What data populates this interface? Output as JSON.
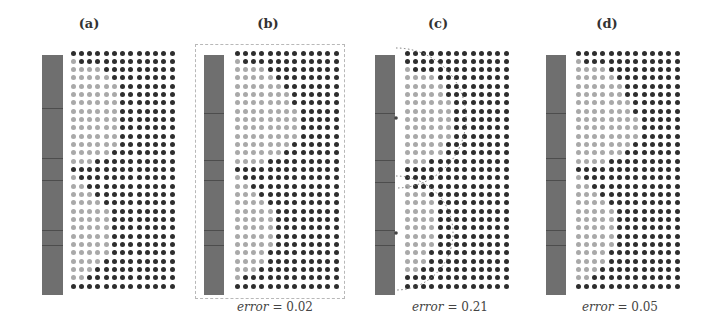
{
  "figure": {
    "grid": {
      "columns": 13,
      "rows": 29,
      "spacing_x": 8.25,
      "spacing_y": 8.33
    },
    "colors": {
      "dark_dot": "#2e2e2e",
      "light_dot": "#a9a9a9",
      "bar": "#6f6f6f",
      "frame": "#b8b8b8"
    },
    "panels": [
      {
        "id": "a",
        "label": "(a)",
        "label_x": 89,
        "bar": {
          "x": 42,
          "y": 55,
          "w": 21,
          "h": 240,
          "ticks": [
            108,
            158,
            180,
            230,
            245
          ]
        },
        "grid_origin": {
          "x": 73,
          "y": 53
        },
        "light_counts": [
          0,
          1,
          4,
          5,
          6,
          6,
          6,
          6,
          6,
          6,
          6,
          6,
          5,
          3,
          0,
          1,
          2,
          3,
          4,
          5,
          5,
          5,
          5,
          5,
          5,
          4,
          3,
          2,
          0
        ],
        "frame": null,
        "error": null,
        "circles": false
      },
      {
        "id": "b",
        "label": "(b)",
        "label_x": 268,
        "bar": {
          "x": 204,
          "y": 55,
          "w": 20,
          "h": 240,
          "ticks": [
            113,
            160,
            180,
            230,
            245
          ]
        },
        "grid_origin": {
          "x": 237,
          "y": 53
        },
        "light_counts": [
          0,
          1,
          4,
          5,
          6,
          7,
          7,
          8,
          8,
          8,
          8,
          7,
          6,
          4,
          0,
          1,
          2,
          3,
          4,
          5,
          5,
          5,
          5,
          5,
          4,
          4,
          3,
          1,
          0
        ],
        "frame": {
          "x": 195,
          "y": 44,
          "w": 150,
          "h": 255
        },
        "error": {
          "word": "error",
          "value": "= 0.02",
          "x": 275
        },
        "circles": false
      },
      {
        "id": "c",
        "label": "(c)",
        "label_x": 438,
        "bar": {
          "x": 375,
          "y": 55,
          "w": 20,
          "h": 240,
          "ticks": [
            113,
            160,
            182,
            230,
            245
          ]
        },
        "grid_origin": {
          "x": 407,
          "y": 53
        },
        "light_counts": [
          0,
          0,
          1,
          4,
          5,
          5,
          6,
          6,
          6,
          6,
          6,
          5,
          5,
          3,
          0,
          0,
          1,
          3,
          4,
          4,
          4,
          4,
          4,
          4,
          3,
          3,
          2,
          0,
          0
        ],
        "frame": null,
        "error": {
          "word": "error",
          "value": "= 0.21",
          "x": 450
        },
        "circles": true,
        "circle_marks": [
          {
            "cx": 396,
            "cy": 118,
            "r": 70
          },
          {
            "cx": 396,
            "cy": 233,
            "r": 57
          }
        ]
      },
      {
        "id": "d",
        "label": "(d)",
        "label_x": 607,
        "bar": {
          "x": 546,
          "y": 55,
          "w": 20,
          "h": 240,
          "ticks": [
            113,
            158,
            180,
            230,
            245
          ]
        },
        "grid_origin": {
          "x": 578,
          "y": 53
        },
        "light_counts": [
          0,
          1,
          4,
          5,
          6,
          6,
          7,
          7,
          8,
          8,
          8,
          7,
          6,
          4,
          0,
          1,
          2,
          3,
          4,
          5,
          5,
          5,
          5,
          5,
          4,
          4,
          3,
          2,
          0
        ],
        "frame": null,
        "error": {
          "word": "error",
          "value": "= 0.05",
          "x": 620
        },
        "circles": false
      }
    ]
  }
}
